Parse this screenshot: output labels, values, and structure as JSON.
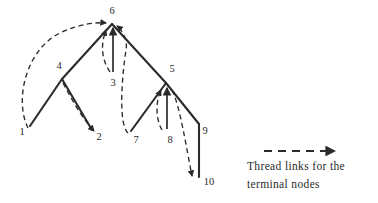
{
  "figure": {
    "background_color": "#ffffff",
    "stroke_color": "#2b2b2b",
    "width": 378,
    "height": 203
  },
  "nodes": [
    {
      "id": "1",
      "label": "1",
      "type": "terminal",
      "x": 30,
      "y": 125,
      "label_x": 22,
      "label_y": 133
    },
    {
      "id": "2",
      "label": "2",
      "type": "terminal",
      "x": 92,
      "y": 130,
      "label_x": 99,
      "label_y": 138
    },
    {
      "id": "3",
      "label": "3",
      "type": "terminal",
      "x": 113,
      "y": 74,
      "label_x": 113,
      "label_y": 84
    },
    {
      "id": "4",
      "label": "4",
      "type": "internal",
      "x": 62,
      "y": 79,
      "label_x": 59,
      "label_y": 67
    },
    {
      "id": "5",
      "label": "5",
      "type": "internal",
      "x": 166,
      "y": 83,
      "label_x": 172,
      "label_y": 70
    },
    {
      "id": "6",
      "label": "6",
      "type": "root",
      "x": 112,
      "y": 23,
      "label_x": 112,
      "label_y": 12
    },
    {
      "id": "7",
      "label": "7",
      "type": "terminal",
      "x": 131,
      "y": 131,
      "label_x": 136,
      "label_y": 141
    },
    {
      "id": "8",
      "label": "8",
      "type": "terminal",
      "x": 166,
      "y": 131,
      "label_x": 170,
      "label_y": 141
    },
    {
      "id": "9",
      "label": "9",
      "type": "internal",
      "x": 199,
      "y": 124,
      "label_x": 205,
      "label_y": 132
    },
    {
      "id": "10",
      "label": "10",
      "type": "terminal",
      "x": 199,
      "y": 177,
      "label_x": 209,
      "label_y": 183
    }
  ],
  "solid_edges": [
    {
      "from": "6",
      "to": "4"
    },
    {
      "from": "6",
      "to": "5"
    },
    {
      "from": "4",
      "to": "1"
    },
    {
      "from": "4",
      "to": "2"
    },
    {
      "from": "5",
      "to": "7"
    },
    {
      "from": "5",
      "to": "9"
    },
    {
      "from": "9",
      "to": "10"
    }
  ],
  "solid_thread_arrows": [
    {
      "from": "3",
      "to": "6",
      "note": "vertical arrow from 3 up to 6"
    },
    {
      "from": "8",
      "to": "5",
      "note": "vertical arrow from 8 up to 5"
    }
  ],
  "thread_links": [
    {
      "from": "1",
      "to": "6",
      "style": "dashed",
      "note": "left outer arc"
    },
    {
      "from": "4",
      "to": "2",
      "style": "dashed",
      "note": "arc down to 2"
    },
    {
      "from": "3",
      "to": "4",
      "style": "dashed",
      "note": "arc up-left to 4"
    },
    {
      "from": "7",
      "to": "6",
      "style": "dashed",
      "note": "arc up to 6"
    },
    {
      "from": "8",
      "to": "5",
      "style": "dashed",
      "note": "short arc to 5"
    },
    {
      "from": "5",
      "to": "10",
      "style": "dashed",
      "note": "arc down to 10"
    }
  ],
  "legend": {
    "sample_style": "dashed-arrow",
    "line1": "Thread links for the",
    "line2": "terminal nodes"
  }
}
